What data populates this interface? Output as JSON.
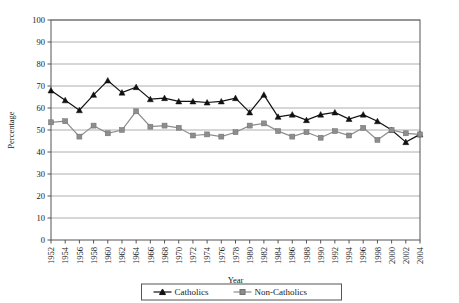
{
  "chart_data": {
    "type": "line",
    "title": "",
    "xlabel": "Year",
    "ylabel": "Percentage",
    "ylim": [
      0,
      100
    ],
    "ytick_step": 10,
    "grid": true,
    "legend_position": "bottom-center",
    "categories": [
      1952,
      1954,
      1956,
      1958,
      1960,
      1962,
      1964,
      1966,
      1968,
      1970,
      1972,
      1974,
      1976,
      1978,
      1980,
      1982,
      1984,
      1986,
      1988,
      1990,
      1992,
      1994,
      1996,
      1998,
      2000,
      2002,
      2004
    ],
    "xtick_labels": [
      "1952",
      "1954",
      "1956",
      "1958",
      "1960",
      "1962",
      "1964",
      "1966",
      "1968",
      "1970",
      "1972",
      "1974",
      "1976",
      "1978",
      "1980",
      "1982",
      "1984",
      "1986",
      "1988",
      "1990",
      "1992",
      "1994",
      "1996",
      "1998",
      "2000",
      "2002",
      "2004"
    ],
    "ytick_labels": [
      "0",
      "10",
      "20",
      "30",
      "40",
      "50",
      "60",
      "70",
      "80",
      "90",
      "100"
    ],
    "series": [
      {
        "name": "Catholics",
        "color": "#111111",
        "marker": "triangle",
        "values": [
          68,
          63.5,
          59,
          66,
          72.5,
          67,
          69.5,
          64,
          64.5,
          63,
          63,
          62.5,
          63,
          64.5,
          58,
          66,
          56,
          57,
          54.5,
          57,
          58,
          55,
          57,
          54,
          50,
          44.5,
          48
        ]
      },
      {
        "name": "Non-Catholics",
        "color": "#8d8d8d",
        "marker": "square",
        "values": [
          53.5,
          54,
          47,
          52,
          48.5,
          50,
          58.5,
          51.5,
          52,
          51,
          47.5,
          48,
          47,
          49,
          52,
          53,
          49.5,
          47,
          49,
          46.5,
          49.5,
          47.5,
          51,
          45.5,
          50,
          48.5,
          48
        ]
      }
    ]
  },
  "legend": {
    "items": [
      {
        "label": "Catholics",
        "marker": "triangle",
        "color": "#111111"
      },
      {
        "label": "Non-Catholics",
        "marker": "square",
        "color": "#8d8d8d"
      }
    ]
  }
}
